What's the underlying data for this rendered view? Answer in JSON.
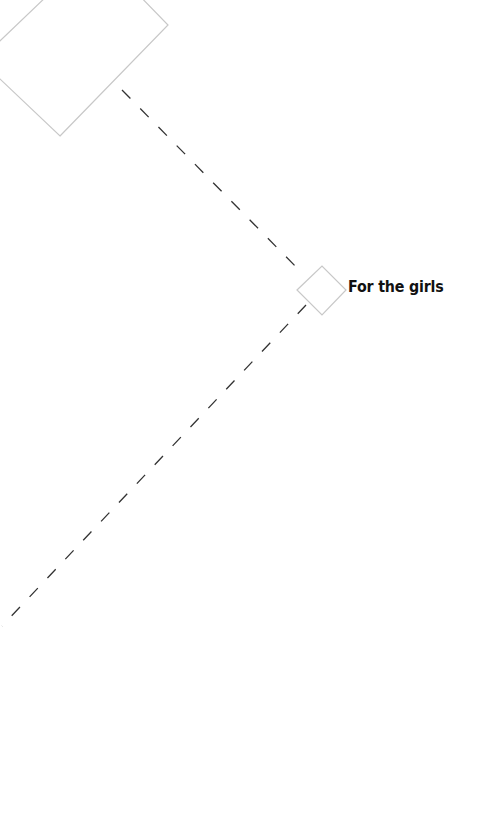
{
  "diagram": {
    "type": "mindmap-branch",
    "nodes": [
      {
        "id": "parent",
        "label": "",
        "shape": "diamond",
        "border_color": "#c8c8c8"
      },
      {
        "id": "child",
        "label": "For the girls",
        "shape": "diamond",
        "border_color": "#c8c8c8"
      }
    ],
    "edges": [
      {
        "from": "parent",
        "to": "child",
        "style": "dashed",
        "color": "#333333"
      },
      {
        "from": "child",
        "to": "offscreen",
        "style": "dashed",
        "color": "#333333"
      }
    ]
  },
  "colors": {
    "background": "#ffffff",
    "node_border": "#c8c8c8",
    "edge": "#333333",
    "label": "#111111"
  }
}
